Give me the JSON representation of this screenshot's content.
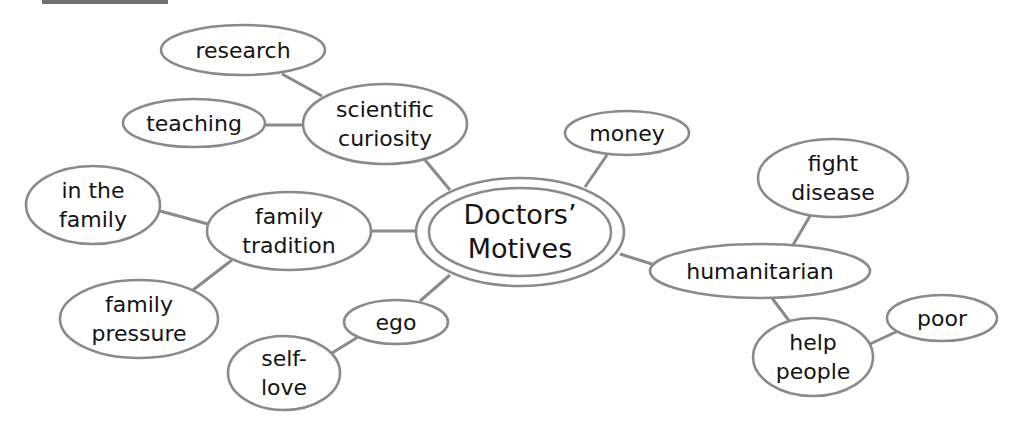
{
  "header": {
    "label": ""
  },
  "diagram": {
    "style": {
      "stroke_color": "#8a8a8a",
      "text_color": "#141414",
      "background": "#ffffff"
    },
    "center": {
      "id": "center",
      "lines": [
        "Doctors’",
        "Motives"
      ],
      "cx": 520,
      "cy": 232,
      "rx": 104,
      "ry": 54,
      "inner_rx": 91,
      "inner_ry": 44
    },
    "nodes": [
      {
        "id": "research",
        "lines": [
          "research"
        ],
        "cx": 243,
        "cy": 50,
        "rx": 82,
        "ry": 25
      },
      {
        "id": "teaching",
        "lines": [
          "teaching"
        ],
        "cx": 194,
        "cy": 123,
        "rx": 71,
        "ry": 24
      },
      {
        "id": "scientific-curiosity",
        "lines": [
          "scientific",
          "curiosity"
        ],
        "cx": 385,
        "cy": 124,
        "rx": 82,
        "ry": 40
      },
      {
        "id": "in-the-family",
        "lines": [
          "in the",
          "family"
        ],
        "cx": 93,
        "cy": 205,
        "rx": 67,
        "ry": 39
      },
      {
        "id": "family-tradition",
        "lines": [
          "family",
          "tradition"
        ],
        "cx": 289,
        "cy": 231,
        "rx": 82,
        "ry": 39
      },
      {
        "id": "family-pressure",
        "lines": [
          "family",
          "pressure"
        ],
        "cx": 139,
        "cy": 319,
        "rx": 79,
        "ry": 39
      },
      {
        "id": "ego",
        "lines": [
          "ego"
        ],
        "cx": 396,
        "cy": 322,
        "rx": 52,
        "ry": 22
      },
      {
        "id": "self-love",
        "lines": [
          "self-",
          "love"
        ],
        "cx": 284,
        "cy": 373,
        "rx": 56,
        "ry": 37
      },
      {
        "id": "money",
        "lines": [
          "money"
        ],
        "cx": 627,
        "cy": 133,
        "rx": 62,
        "ry": 22
      },
      {
        "id": "fight-disease",
        "lines": [
          "fight",
          "disease"
        ],
        "cx": 833,
        "cy": 178,
        "rx": 75,
        "ry": 39
      },
      {
        "id": "humanitarian",
        "lines": [
          "humanitarian"
        ],
        "cx": 760,
        "cy": 271,
        "rx": 110,
        "ry": 27
      },
      {
        "id": "help-people",
        "lines": [
          "help",
          "people"
        ],
        "cx": 813,
        "cy": 357,
        "rx": 60,
        "ry": 39
      },
      {
        "id": "poor",
        "lines": [
          "poor"
        ],
        "cx": 942,
        "cy": 318,
        "rx": 55,
        "ry": 23
      }
    ],
    "edges": [
      {
        "from": "research",
        "to": "scientific-curiosity",
        "x1": 282,
        "y1": 74,
        "x2": 322,
        "y2": 96
      },
      {
        "from": "teaching",
        "to": "scientific-curiosity",
        "x1": 265,
        "y1": 125,
        "x2": 303,
        "y2": 125
      },
      {
        "from": "scientific-curiosity",
        "to": "center",
        "x1": 425,
        "y1": 160,
        "x2": 450,
        "y2": 190
      },
      {
        "from": "in-the-family",
        "to": "family-tradition",
        "x1": 160,
        "y1": 211,
        "x2": 208,
        "y2": 224
      },
      {
        "from": "family-tradition",
        "to": "center",
        "x1": 372,
        "y1": 231,
        "x2": 416,
        "y2": 231
      },
      {
        "from": "family-tradition",
        "to": "family-pressure",
        "x1": 232,
        "y1": 260,
        "x2": 193,
        "y2": 290
      },
      {
        "from": "center",
        "to": "ego",
        "x1": 450,
        "y1": 275,
        "x2": 420,
        "y2": 301
      },
      {
        "from": "ego",
        "to": "self-love",
        "x1": 358,
        "y1": 337,
        "x2": 332,
        "y2": 353
      },
      {
        "from": "center",
        "to": "money",
        "x1": 585,
        "y1": 187,
        "x2": 607,
        "y2": 155
      },
      {
        "from": "center",
        "to": "humanitarian",
        "x1": 620,
        "y1": 254,
        "x2": 652,
        "y2": 264
      },
      {
        "from": "humanitarian",
        "to": "fight-disease",
        "x1": 793,
        "y1": 245,
        "x2": 810,
        "y2": 216
      },
      {
        "from": "humanitarian",
        "to": "help-people",
        "x1": 772,
        "y1": 298,
        "x2": 790,
        "y2": 322
      },
      {
        "from": "help-people",
        "to": "poor",
        "x1": 870,
        "y1": 344,
        "x2": 898,
        "y2": 331
      }
    ]
  }
}
